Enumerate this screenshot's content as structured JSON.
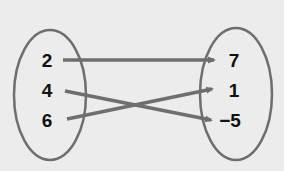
{
  "diagram": {
    "type": "mapping",
    "colors": {
      "background": "#ececec",
      "ellipse_stroke": "#6e6e6e",
      "arrow": "#6e6e6e",
      "text": "#111111"
    },
    "domain": {
      "values": [
        "2",
        "4",
        "6"
      ]
    },
    "range": {
      "values": [
        "7",
        "1",
        "−5"
      ]
    },
    "mappings": [
      {
        "from": "2",
        "to": "7"
      },
      {
        "from": "4",
        "to": "−5"
      },
      {
        "from": "6",
        "to": "1"
      }
    ]
  }
}
